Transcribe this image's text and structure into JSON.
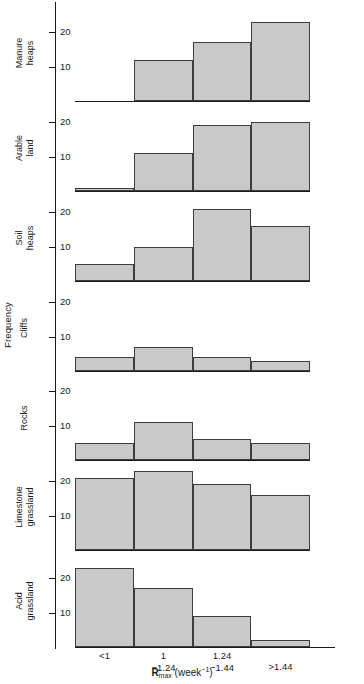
{
  "chart_data": {
    "type": "bar",
    "title": "",
    "subtitle": "",
    "xlabel": "Rmax (week-1)",
    "ylabel": "Frequency",
    "categories": [
      "<1",
      "1\n−1.24",
      "1.24\n−1.44",
      ">1.44"
    ],
    "category_labels_flat": [
      "<1",
      "1 −1.24",
      "1.24 −1.44",
      ">1.44"
    ],
    "ylim": [
      0,
      26
    ],
    "yticks": [
      10,
      20
    ],
    "ytick_labels": [
      "10",
      "20"
    ],
    "grid": false,
    "legend": false,
    "panel_layout": "vertical-stack",
    "series": [
      {
        "name": "Manure heaps",
        "values": [
          0,
          12,
          17,
          23
        ]
      },
      {
        "name": "Arable land",
        "values": [
          1,
          11,
          19,
          20
        ]
      },
      {
        "name": "Soil heaps",
        "values": [
          5,
          10,
          21,
          16
        ]
      },
      {
        "name": "Cliffs",
        "values": [
          4,
          7,
          4,
          3
        ]
      },
      {
        "name": "Rocks",
        "values": [
          5,
          11,
          6,
          5
        ]
      },
      {
        "name": "Limestone grassland",
        "values": [
          21,
          23,
          19,
          16
        ]
      },
      {
        "name": "Acid grassland",
        "values": [
          23,
          17,
          9,
          2
        ]
      }
    ]
  },
  "axis": {
    "y_title": "Frequency",
    "x_title_main": "R",
    "x_title_sub": "max",
    "x_title_rest": " (week",
    "x_title_sup": "−1",
    "x_title_close": ")"
  },
  "panels": [
    {
      "label_lines": [
        "Manure",
        "heaps"
      ]
    },
    {
      "label_lines": [
        "Arable",
        "land"
      ]
    },
    {
      "label_lines": [
        "Soil",
        "heaps"
      ]
    },
    {
      "label_lines": [
        "Cliffs"
      ]
    },
    {
      "label_lines": [
        "Rocks"
      ]
    },
    {
      "label_lines": [
        "Limestone",
        "grassland"
      ]
    },
    {
      "label_lines": [
        "Acid",
        "grassland"
      ]
    }
  ],
  "colors": {
    "bar_fill": "#c9c9c9",
    "bar_stroke": "#3d3d3d",
    "axis": "#1a1a1a",
    "background": "#ffffff"
  }
}
